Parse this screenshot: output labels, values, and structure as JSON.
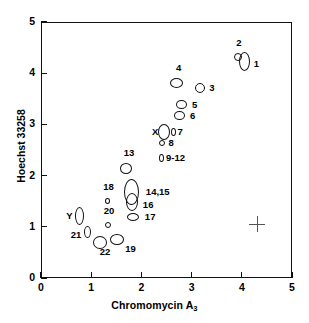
{
  "chart_data": {
    "type": "scatter",
    "title": "",
    "xlabel": "Chromomycin A3",
    "xlabel_base": "Chromomycin A",
    "xlabel_sub": "3",
    "ylabel": "Hoechst 33258",
    "xlim": [
      0,
      5
    ],
    "ylim": [
      0,
      5
    ],
    "xticks": [
      "0",
      "1",
      "2",
      "3",
      "4",
      "5"
    ],
    "yticks": [
      "0",
      "1",
      "2",
      "3",
      "4",
      "5"
    ],
    "grid": false,
    "legend": "none",
    "marker_style": "open-ellipse",
    "annotation": {
      "name": "error-cross",
      "x": 4.3,
      "y": 1.05,
      "half_width": 0.16,
      "half_height": 0.16
    },
    "points": [
      {
        "label": "1",
        "x": 4.05,
        "y": 4.22,
        "rx": 5.5,
        "ry": 9.5,
        "label_dx": 8,
        "label_dy": 2
      },
      {
        "label": "2",
        "x": 3.93,
        "y": 4.32,
        "rx": 4.0,
        "ry": 4.0,
        "label_dx": -2,
        "label_dy": -14
      },
      {
        "label": "3",
        "x": 3.17,
        "y": 3.71,
        "rx": 5.0,
        "ry": 5.0,
        "label_dx": 8,
        "label_dy": 0
      },
      {
        "label": "4",
        "x": 2.7,
        "y": 3.8,
        "rx": 6.5,
        "ry": 5.0,
        "label_dx": -3,
        "label_dy": -15
      },
      {
        "label": "5",
        "x": 2.8,
        "y": 3.38,
        "rx": 5.5,
        "ry": 4.5,
        "label_dx": 9,
        "label_dy": 0
      },
      {
        "label": "6",
        "x": 2.76,
        "y": 3.17,
        "rx": 5.5,
        "ry": 4.5,
        "label_dx": 9,
        "label_dy": 0
      },
      {
        "label": "X",
        "x": 2.45,
        "y": 2.85,
        "rx": 6.0,
        "ry": 8.0,
        "label_dx": -14,
        "label_dy": 0
      },
      {
        "label": "7",
        "x": 2.63,
        "y": 2.86,
        "rx": 2.5,
        "ry": 4.0,
        "label_dx": 6,
        "label_dy": 0
      },
      {
        "label": "8",
        "x": 2.42,
        "y": 2.63,
        "rx": 3.0,
        "ry": 3.0,
        "label_dx": 7,
        "label_dy": 0
      },
      {
        "label": "9-12",
        "x": 2.4,
        "y": 2.35,
        "rx": 2.5,
        "ry": 4.0,
        "label_dx": 6,
        "label_dy": 0
      },
      {
        "label": "13",
        "x": 1.69,
        "y": 2.13,
        "rx": 6.0,
        "ry": 5.5,
        "label_dx": -4,
        "label_dy": -16
      },
      {
        "label": "14,15",
        "x": 1.8,
        "y": 1.68,
        "rx": 7.5,
        "ry": 13.0,
        "label_dx": 11,
        "label_dy": 0
      },
      {
        "label": "16",
        "x": 1.81,
        "y": 1.48,
        "rx": 6.0,
        "ry": 9.0,
        "label_dx": 9,
        "label_dy": 3
      },
      {
        "label": "17",
        "x": 1.83,
        "y": 1.2,
        "rx": 6.0,
        "ry": 4.0,
        "label_dx": 10,
        "label_dy": 0
      },
      {
        "label": "18",
        "x": 1.33,
        "y": 1.51,
        "rx": 2.5,
        "ry": 3.0,
        "label_dx": -3,
        "label_dy": -14
      },
      {
        "label": "19",
        "x": 1.52,
        "y": 0.75,
        "rx": 7.0,
        "ry": 5.5,
        "label_dx": 5,
        "label_dy": 9
      },
      {
        "label": "20",
        "x": 1.33,
        "y": 1.04,
        "rx": 3.0,
        "ry": 3.0,
        "label_dx": -3,
        "label_dy": -14
      },
      {
        "label": "21",
        "x": 0.92,
        "y": 0.89,
        "rx": 3.5,
        "ry": 6.0,
        "label_dx": -16,
        "label_dy": 3
      },
      {
        "label": "22",
        "x": 1.17,
        "y": 0.7,
        "rx": 7.0,
        "ry": 6.5,
        "label_dx": -3,
        "label_dy": 10
      },
      {
        "label": "Y",
        "x": 0.77,
        "y": 1.22,
        "rx": 4.5,
        "ry": 9.0,
        "label_dx": -14,
        "label_dy": 0
      }
    ]
  }
}
